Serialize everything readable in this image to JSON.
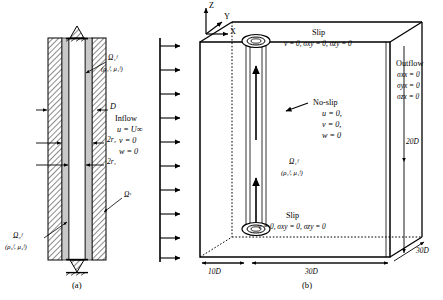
{
  "figure": {
    "panel_a": {
      "caption": "(a)",
      "description": "Axial cross-section of concentric pipe with two fluid layers and a solid shell",
      "labels": {
        "fluid1_domain": "Ω₁ᶠ",
        "fluid1_props": "(ρ₁ᶠ, μ₁ᶠ)",
        "fluid2_domain": "Ω₂ᶠ",
        "fluid2_props": "(ρ₂ᶠ, μ₂ᶠ)",
        "solid_domain": "Ωˢ",
        "diameter": "D",
        "outer_radius": "2r₂",
        "inner_radius": "2r₁"
      },
      "inflow": {
        "title": "Inflow",
        "line1": "u = U∞",
        "line2": "v = 0",
        "line3": "w = 0"
      }
    },
    "panel_b": {
      "caption": "(b)",
      "description": "Three-dimensional computational domain box with boundary conditions",
      "axes": {
        "z": "Z",
        "y": "Y",
        "x": "X"
      },
      "slip_top": {
        "title": "Slip",
        "conditions": "v = 0,  σxy = 0,  σzy = 0"
      },
      "slip_bottom": {
        "title": "Slip",
        "conditions": "v = 0,  σxy = 0,  σzy = 0"
      },
      "no_slip": {
        "title": "No-slip",
        "line1": "u = 0,",
        "line2": "v = 0,",
        "line3": "w = 0"
      },
      "outflow": {
        "title": "Outflow",
        "line1": "σxx = 0",
        "line2": "σyx = 0",
        "line3": "σzx = 0"
      },
      "fluid1_domain": "Ω₁ᶠ",
      "fluid1_props": "(ρ₁ᶠ, μ₁ᶠ)",
      "dimensions": {
        "upstream": "10D",
        "downstream": "30D",
        "height": "20D",
        "depth": "30D"
      }
    }
  },
  "colors": {
    "line": "#000000",
    "fluid_fill": "#ffffff",
    "annulus_fill": "#c8c8c8",
    "hatch": "#000000",
    "box_face": "#ffffff"
  }
}
